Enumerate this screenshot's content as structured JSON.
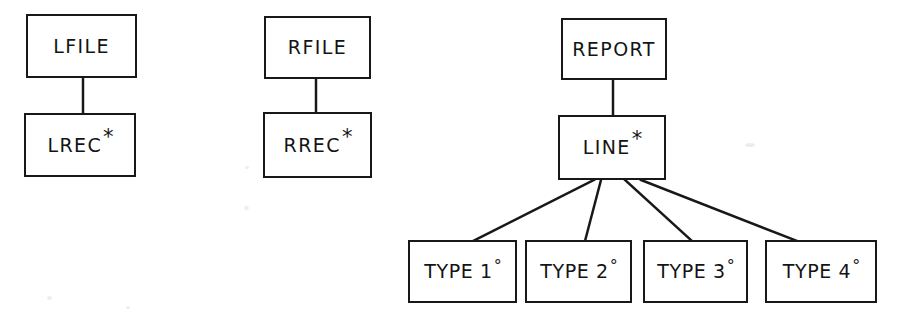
{
  "diagram": {
    "background_color": "#ffffff",
    "line_color": "#181818",
    "text_color": "#141414",
    "trees": [
      {
        "name": "left-file-tree",
        "nodes": [
          {
            "id": "lfile",
            "label": "LFILE",
            "marker": ""
          },
          {
            "id": "lrec",
            "label": "LREC",
            "marker": "*"
          }
        ]
      },
      {
        "name": "right-file-tree",
        "nodes": [
          {
            "id": "rfile",
            "label": "RFILE",
            "marker": ""
          },
          {
            "id": "rrec",
            "label": "RREC",
            "marker": "*"
          }
        ]
      },
      {
        "name": "report-tree",
        "nodes": [
          {
            "id": "report",
            "label": "REPORT",
            "marker": ""
          },
          {
            "id": "line",
            "label": "LINE",
            "marker": "*"
          },
          {
            "id": "type1",
            "label": "TYPE 1",
            "marker": "°"
          },
          {
            "id": "type2",
            "label": "TYPE 2",
            "marker": "°"
          },
          {
            "id": "type3",
            "label": "TYPE 3",
            "marker": "°"
          },
          {
            "id": "type4",
            "label": "TYPE 4",
            "marker": "°"
          }
        ]
      }
    ],
    "markers": {
      "repetition": "*",
      "selection": "°"
    }
  }
}
